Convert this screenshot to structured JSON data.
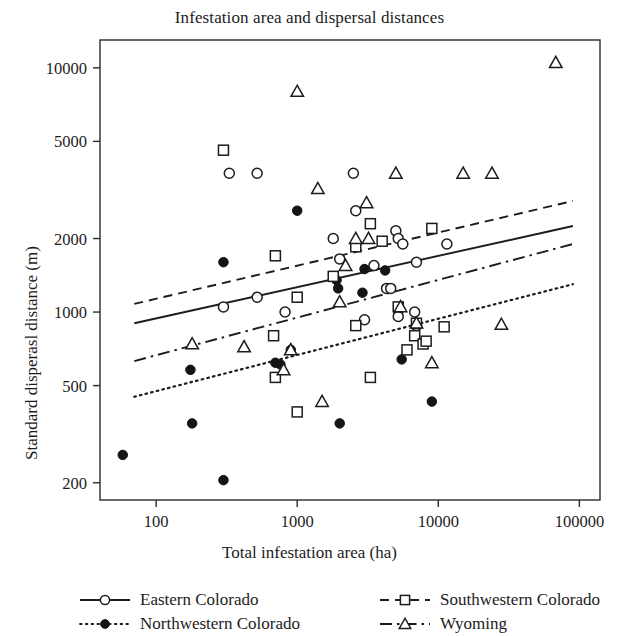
{
  "chart_data": {
    "type": "scatter",
    "title": "Infestation area and dispersal distances",
    "xlabel": "Total infestation area (ha)",
    "ylabel": "Standard disperasl distance (m)",
    "xscale": "log",
    "yscale": "log",
    "xlim": [
      40,
      140000
    ],
    "ylim": [
      170,
      13000
    ],
    "xticks": [
      100,
      1000,
      10000,
      100000
    ],
    "xticklabels": [
      "100",
      "1000",
      "10000",
      "100000"
    ],
    "yticks": [
      200,
      500,
      1000,
      2000,
      5000,
      10000
    ],
    "yticklabels": [
      "200",
      "500",
      "1000",
      "2000",
      "5000",
      "10000"
    ],
    "grid": false,
    "legend_position": "below",
    "series": [
      {
        "name": "Eastern Colorado",
        "marker": "open-circle",
        "linestyle": "solid",
        "color": "#1c1c1c",
        "points": [
          [
            300,
            1050
          ],
          [
            520,
            1150
          ],
          [
            330,
            3700
          ],
          [
            520,
            3700
          ],
          [
            1800,
            2000
          ],
          [
            2500,
            3700
          ],
          [
            2600,
            2600
          ],
          [
            2000,
            1650
          ],
          [
            3500,
            1550
          ],
          [
            5000,
            2150
          ],
          [
            5200,
            2000
          ],
          [
            5600,
            1900
          ],
          [
            7000,
            1600
          ],
          [
            4300,
            1250
          ],
          [
            4600,
            1250
          ],
          [
            5200,
            960
          ],
          [
            7000,
            880
          ],
          [
            6800,
            1000
          ],
          [
            3000,
            930
          ],
          [
            11500,
            1900
          ],
          [
            820,
            1000
          ]
        ]
      },
      {
        "name": "Northwestern Colorado",
        "marker": "filled-circle",
        "linestyle": "dotted",
        "color": "#1c1c1c",
        "points": [
          [
            58,
            260
          ],
          [
            175,
            580
          ],
          [
            180,
            350
          ],
          [
            300,
            205
          ],
          [
            300,
            1600
          ],
          [
            700,
            620
          ],
          [
            760,
            610
          ],
          [
            900,
            700
          ],
          [
            1000,
            2600
          ],
          [
            1900,
            1350
          ],
          [
            1950,
            1250
          ],
          [
            2900,
            1200
          ],
          [
            3000,
            1500
          ],
          [
            4200,
            1480
          ],
          [
            2000,
            350
          ],
          [
            5500,
            640
          ],
          [
            9000,
            430
          ]
        ]
      },
      {
        "name": "Southwestern Colorado",
        "marker": "open-square",
        "linestyle": "dashed",
        "color": "#1c1c1c",
        "points": [
          [
            300,
            4600
          ],
          [
            700,
            1700
          ],
          [
            680,
            800
          ],
          [
            700,
            540
          ],
          [
            1000,
            390
          ],
          [
            1000,
            1150
          ],
          [
            1800,
            1400
          ],
          [
            2600,
            1850
          ],
          [
            3300,
            2300
          ],
          [
            4000,
            1950
          ],
          [
            5200,
            1050
          ],
          [
            2600,
            880
          ],
          [
            6000,
            700
          ],
          [
            6800,
            800
          ],
          [
            7000,
            900
          ],
          [
            7800,
            740
          ],
          [
            8200,
            760
          ],
          [
            9000,
            2200
          ],
          [
            11000,
            870
          ],
          [
            3300,
            540
          ]
        ]
      },
      {
        "name": "Wyoming",
        "marker": "open-triangle",
        "linestyle": "dashdot",
        "color": "#1c1c1c",
        "points": [
          [
            180,
            740
          ],
          [
            420,
            720
          ],
          [
            800,
            580
          ],
          [
            900,
            700
          ],
          [
            1000,
            8000
          ],
          [
            1400,
            3200
          ],
          [
            1500,
            430
          ],
          [
            2200,
            1550
          ],
          [
            2600,
            2000
          ],
          [
            3100,
            2800
          ],
          [
            3200,
            2000
          ],
          [
            5000,
            3700
          ],
          [
            5400,
            1050
          ],
          [
            7000,
            900
          ],
          [
            9000,
            620
          ],
          [
            15000,
            3700
          ],
          [
            24000,
            3700
          ],
          [
            28000,
            890
          ],
          [
            68000,
            10500
          ],
          [
            2000,
            1100
          ]
        ]
      }
    ],
    "trend_lines": [
      {
        "name": "Eastern Colorado",
        "linestyle": "solid",
        "x0": 70,
        "y0": 900,
        "x1": 90000,
        "y1": 2250
      },
      {
        "name": "Southwestern Colorado",
        "linestyle": "dashed",
        "x0": 70,
        "y0": 1080,
        "x1": 90000,
        "y1": 2850
      },
      {
        "name": "Wyoming",
        "linestyle": "dashdot",
        "x0": 70,
        "y0": 630,
        "x1": 90000,
        "y1": 1900
      },
      {
        "name": "Northwestern Colorado",
        "linestyle": "dotted",
        "x0": 70,
        "y0": 450,
        "x1": 90000,
        "y1": 1300
      }
    ]
  },
  "legend": {
    "entries": [
      {
        "label": "Eastern Colorado",
        "marker": "open-circle",
        "linestyle": "solid"
      },
      {
        "label": "Northwestern Colorado",
        "marker": "filled-circle",
        "linestyle": "dotted"
      },
      {
        "label": "Southwestern Colorado",
        "marker": "open-square",
        "linestyle": "dashed"
      },
      {
        "label": "Wyoming",
        "marker": "open-triangle",
        "linestyle": "dashdot"
      }
    ]
  }
}
